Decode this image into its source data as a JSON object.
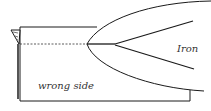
{
  "diagram": {
    "labels": {
      "iron": "Iron",
      "fabric": "wrong side"
    },
    "colors": {
      "stroke": "#1a1a1a",
      "background": "#ffffff",
      "text": "#333333"
    }
  }
}
